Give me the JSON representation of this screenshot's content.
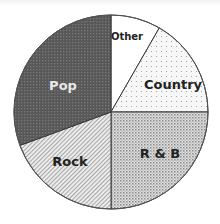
{
  "chart_data": {
    "type": "pie",
    "title": "",
    "start_angle_deg": 0,
    "direction": "clockwise",
    "categories": [
      "Other",
      "Country",
      "R & B",
      "Rock",
      "Pop"
    ],
    "values": [
      8.3,
      16.7,
      25.0,
      19.4,
      30.6
    ],
    "unit": "percent (estimated from slice angles)",
    "legend": "none (labels inside slices)",
    "slices": [
      {
        "label": "Other",
        "value": 8.3,
        "fill": "#ffffff",
        "pattern": "none",
        "label_color": "#222222",
        "label_x": 127,
        "label_y": 36,
        "label_size": 10
      },
      {
        "label": "Country",
        "value": 16.7,
        "fill": "#f4f4f4",
        "pattern": "sparse-dots",
        "label_color": "#222222",
        "label_x": 173,
        "label_y": 84,
        "label_size": 13
      },
      {
        "label": "R & B",
        "value": 25.0,
        "fill": "#bdbdbd",
        "pattern": "dense-dots",
        "label_color": "#222222",
        "label_x": 160,
        "label_y": 153,
        "label_size": 13
      },
      {
        "label": "Rock",
        "value": 19.4,
        "fill": "#dadada",
        "pattern": "diagonal-lines",
        "label_color": "#222222",
        "label_x": 70,
        "label_y": 161,
        "label_size": 13
      },
      {
        "label": "Pop",
        "value": 30.6,
        "fill": "#5c5c5c",
        "pattern": "dark-dots",
        "label_color": "#e8e8e8",
        "label_x": 63,
        "label_y": 85,
        "label_size": 13
      }
    ],
    "center": [
      111,
      112
    ],
    "radius": 97
  }
}
